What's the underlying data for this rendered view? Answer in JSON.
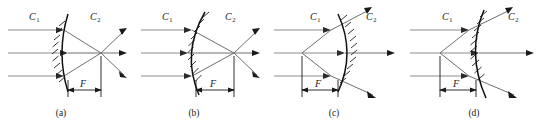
{
  "figure": {
    "background_color": "#ffffff",
    "width": 542,
    "height": 125,
    "medium_label_left": "C",
    "medium_label_right": "C",
    "medium_sub_left": "1",
    "medium_sub_right": "2",
    "focal_label": "F",
    "colors": {
      "surface": "#111111",
      "incoming_ray": "#8c8c8c",
      "outgoing_ray": "#6f6f6f",
      "arrowhead": "#1a1a1a",
      "text": "#1a1a1a"
    }
  },
  "panels": [
    {
      "id": "panel-a",
      "caption": "(a)",
      "label_left": "C",
      "label_left_sub": "1",
      "label_right": "C",
      "label_right_sub": "2",
      "focal_label": "F",
      "surface_curvature": "convex-left",
      "hatch_side": "left",
      "focus_side": "right",
      "focus_type": "real-converging",
      "ray_count": 3,
      "description": "Convex surface bulging toward medium C1, hatching on left, rays converge to a real focus at distance F to the right of the vertex."
    },
    {
      "id": "panel-b",
      "caption": "(b)",
      "label_left": "C",
      "label_left_sub": "1",
      "label_right": "C",
      "label_right_sub": "2",
      "focal_label": "F",
      "surface_curvature": "concave-left",
      "hatch_side": "left",
      "focus_side": "right",
      "focus_type": "real-converging",
      "ray_count": 3,
      "description": "Concave surface opening toward medium C2, hatching on left, rays converge to a real focus at distance F to the right of the vertex."
    },
    {
      "id": "panel-c",
      "caption": "(c)",
      "label_left": "C",
      "label_left_sub": "1",
      "label_right": "C",
      "label_right_sub": "2",
      "focal_label": "F",
      "surface_curvature": "concave-left",
      "hatch_side": "right",
      "focus_side": "left",
      "focus_type": "virtual-diverging",
      "ray_count": 3,
      "description": "Concave surface with hatching on the right, rays diverge after the surface and trace back to a virtual focus at distance F to the left of the vertex."
    },
    {
      "id": "panel-d",
      "caption": "(d)",
      "label_left": "C",
      "label_left_sub": "1",
      "label_right": "C",
      "label_right_sub": "2",
      "focal_label": "F",
      "surface_curvature": "convex-left",
      "hatch_side": "right",
      "focus_side": "left",
      "focus_type": "virtual-diverging",
      "ray_count": 3,
      "description": "Convex surface with hatching on the right, rays diverge after the surface and trace back to a virtual focus at distance F to the left of the vertex."
    }
  ]
}
